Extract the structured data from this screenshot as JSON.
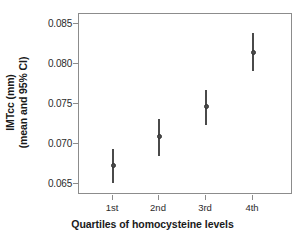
{
  "chart_data": {
    "type": "scatter",
    "title": "",
    "xlabel": "Quartiles of homocysteine levels",
    "ylabel": "IMTcc (mm)\n(mean and 95% CI)",
    "ylabel_line1": "IMTcc (mm)",
    "ylabel_line2": "(mean and 95% CI)",
    "categories": [
      "1st",
      "2nd",
      "3rd",
      "4th"
    ],
    "xtick_labels": [
      "1st",
      "2nd",
      "3rd",
      "4th"
    ],
    "ytick_labels": [
      "0.085",
      "0.080",
      "0.075",
      "0.070",
      "0.065"
    ],
    "yticks": [
      0.085,
      0.08,
      0.075,
      0.07,
      0.065
    ],
    "ylim": [
      0.0635,
      0.0863
    ],
    "grid": false,
    "legend": null,
    "error_style": "vertical-line-95CI",
    "series": [
      {
        "name": "IMTcc mean with 95% CI",
        "color": "#4a4a4a",
        "values": [
          0.0673,
          0.0709,
          0.0747,
          0.0815
        ],
        "ci_low": [
          0.0651,
          0.0685,
          0.0724,
          0.0791
        ],
        "ci_high": [
          0.0694,
          0.0731,
          0.0767,
          0.0839
        ]
      }
    ],
    "points": [
      {
        "category": "1st",
        "mean": 0.0673,
        "ci_low": 0.0651,
        "ci_high": 0.0694
      },
      {
        "category": "2nd",
        "mean": 0.0709,
        "ci_low": 0.0685,
        "ci_high": 0.0731
      },
      {
        "category": "3rd",
        "mean": 0.0747,
        "ci_low": 0.0724,
        "ci_high": 0.0767
      },
      {
        "category": "4th",
        "mean": 0.0815,
        "ci_low": 0.0791,
        "ci_high": 0.0839
      }
    ],
    "colors": {
      "marker": "#4a4a4a",
      "errorbar": "#4a4a4a",
      "axis": "#8c8c8c",
      "text": "#1a1a1a",
      "background": "#ffffff"
    }
  }
}
